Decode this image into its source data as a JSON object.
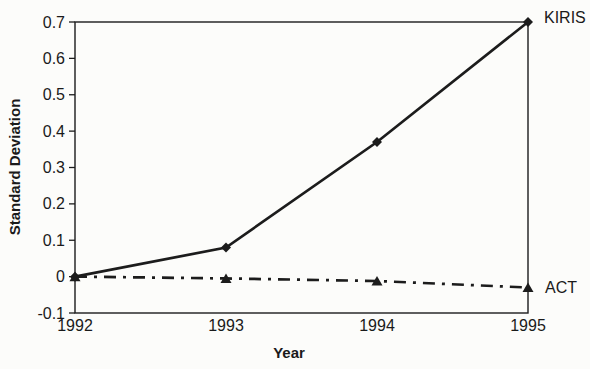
{
  "chart_data": {
    "type": "line",
    "title": "",
    "xlabel": "Year",
    "ylabel": "Standard Deviation",
    "x": [
      1992,
      1993,
      1994,
      1995
    ],
    "x_tick_labels": [
      "1992",
      "1993",
      "1994",
      "1995"
    ],
    "y_tick_labels": [
      "0.7",
      "0.6",
      "0.5",
      "0.4",
      "0.3",
      "0.2",
      "0.1",
      "0",
      "-0.1"
    ],
    "y_tick_values": [
      0.7,
      0.6,
      0.5,
      0.4,
      0.3,
      0.2,
      0.1,
      0,
      -0.1
    ],
    "ylim": [
      -0.1,
      0.7
    ],
    "xlim": [
      1992,
      1995
    ],
    "grid": false,
    "legend_position": "right-of-line-ends",
    "colors": {
      "line": "#1c1c1c",
      "text": "#1a1a1a",
      "background": "#fcfcfa"
    },
    "series": [
      {
        "name": "KIRIS",
        "values": [
          0,
          0.08,
          0.37,
          0.7
        ],
        "line_style": "solid",
        "marker": "diamond"
      },
      {
        "name": "ACT",
        "values": [
          0,
          -0.005,
          -0.012,
          -0.03
        ],
        "line_style": "dash-dot",
        "marker": "triangle"
      }
    ]
  }
}
